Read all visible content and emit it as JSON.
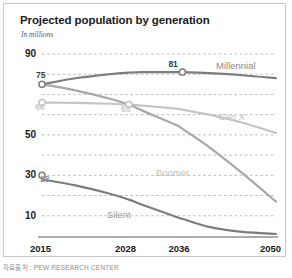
{
  "chart_data": {
    "type": "line",
    "title": "Projected population by generation",
    "subtitle": "In millions",
    "xlabel": "",
    "ylabel": "",
    "grid": true,
    "legend_position": "inline-right",
    "x": [
      2015,
      2020,
      2025,
      2028,
      2030,
      2035,
      2036,
      2040,
      2045,
      2050
    ],
    "xlim": [
      2015,
      2050
    ],
    "ylim": [
      0,
      90
    ],
    "xticks": [
      "2015",
      "2028",
      "2036",
      "2050"
    ],
    "xtick_values": [
      2015,
      2028,
      2036,
      2050
    ],
    "yticks": [
      "90",
      "50",
      "30",
      "10"
    ],
    "ytick_values": [
      90,
      50,
      30,
      10
    ],
    "gridline_values": [
      90,
      80,
      70,
      60,
      50,
      40,
      30,
      20,
      10
    ],
    "series": [
      {
        "name": "Millennial",
        "color": "#7d7d7d",
        "values": [
          75,
          78,
          80,
          80.8,
          81,
          81,
          81,
          80.5,
          79.5,
          78
        ],
        "label_position": "top-right"
      },
      {
        "name": "Gen X",
        "color": "#c4c4c4",
        "values": [
          66,
          65.8,
          65.4,
          65,
          64.5,
          63,
          62.5,
          60,
          56,
          51
        ],
        "label_position": "right"
      },
      {
        "name": "Boomer",
        "color": "#a8a8a8",
        "values": [
          75,
          72,
          68,
          65,
          62,
          55,
          53,
          44,
          31,
          17
        ],
        "label_position": "middle"
      },
      {
        "name": "Silent",
        "color": "#7d7d7d",
        "values": [
          28,
          25,
          21,
          18,
          15.5,
          9.5,
          8.5,
          4.5,
          2,
          1
        ],
        "label_position": "bottom-middle"
      }
    ],
    "annotations": [
      {
        "text": "75",
        "series": "Millennial",
        "x": 2015,
        "y": 75,
        "marker": true,
        "color": "#3c3c3c"
      },
      {
        "text": "81",
        "series": "Millennial",
        "x": 2036,
        "y": 81,
        "marker": true,
        "color": "#3c3c3c"
      },
      {
        "text": "66",
        "series": "Gen X",
        "x": 2015,
        "y": 66,
        "marker": true,
        "color": "#c4c4c4"
      },
      {
        "text": "65",
        "series": "Gen X",
        "x": 2028,
        "y": 65,
        "marker": true,
        "color": "#c4c4c4"
      },
      {
        "text": "30",
        "series": "Silent",
        "x": 2015,
        "y": 30,
        "marker": true,
        "color": "#3c3c3c"
      },
      {
        "text": "28",
        "series": "Silent",
        "x": 2015,
        "y": 28,
        "marker": false,
        "color": "#9a9a9a"
      }
    ]
  },
  "caption": {
    "text": "자료출처 : PEW RESEARCH CENTER"
  },
  "colors": {
    "grid": "#b6b6b6",
    "axis": "#8f8f8f",
    "title": "#1b1b1b",
    "frame": "#c9c9c9"
  }
}
